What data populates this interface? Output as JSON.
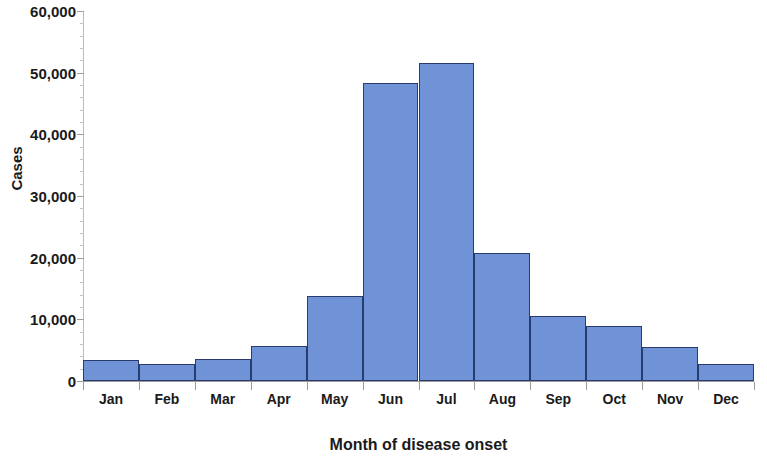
{
  "chart_data": {
    "type": "bar",
    "title": "",
    "xlabel": "Month of disease onset",
    "ylabel": "Cases",
    "categories": [
      "Jan",
      "Feb",
      "Mar",
      "Apr",
      "May",
      "Jun",
      "Jul",
      "Aug",
      "Sep",
      "Oct",
      "Nov",
      "Dec"
    ],
    "values": [
      3400,
      2700,
      3600,
      5600,
      13800,
      48400,
      51600,
      20800,
      10500,
      9000,
      5500,
      2800
    ],
    "ylim": [
      0,
      60000
    ],
    "ytick_labels": [
      "0",
      "10,000",
      "20,000",
      "30,000",
      "40,000",
      "50,000",
      "60,000"
    ],
    "ytick_values": [
      0,
      10000,
      20000,
      30000,
      40000,
      50000,
      60000
    ],
    "y_minor_tick_interval": 2000,
    "grid": false,
    "legend": null,
    "bar_color": "#6f93d6",
    "bar_border_color": "#283c6e",
    "axis_color": "#9a9a9a",
    "text_color": "#1a1a1a"
  }
}
